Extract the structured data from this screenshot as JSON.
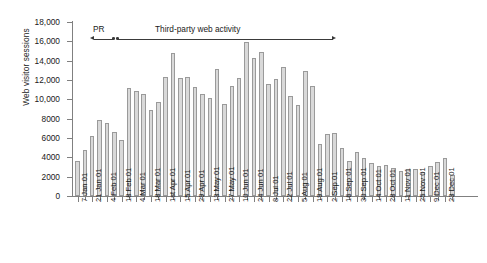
{
  "chart_data": {
    "type": "bar",
    "title": "",
    "xlabel": "",
    "ylabel": "Web visitor sessions",
    "ylim": [
      0,
      18000
    ],
    "ytick_labels": [
      "18,000",
      "16,000",
      "14,000",
      "12,000",
      "10,000",
      "8000",
      "6000",
      "4000",
      "2000",
      "0"
    ],
    "ytick_values": [
      18000,
      16000,
      14000,
      12000,
      10000,
      8000,
      6000,
      4000,
      2000,
      0
    ],
    "grid": false,
    "legend": "none",
    "categories": [
      "7 Jan 01",
      "14 Jan 01",
      "21 Jan 01",
      "28 Jan 01",
      "4 Feb 01",
      "11 Feb 01",
      "18 Feb 01",
      "25 Feb 01",
      "4 Mar 01",
      "11 Mar 01",
      "18 Mar 01",
      "25 Mar 01",
      "1st Apr 01",
      "8 Apr 01",
      "15 Apr 01",
      "22 Apr 01",
      "29 Apr 01",
      "6 May 01",
      "13 May 01",
      "20 May 01",
      "27 May 01",
      "3 Jun 01",
      "10 Jun 01",
      "17 Jun 01",
      "24 Jun 01",
      "1 Jul 01",
      "8 Jul 01",
      "15 Jul 01",
      "22 Jul 01",
      "29 Jul 01",
      "5 Aug 01",
      "12 Aug 01",
      "19 Aug 01",
      "26 Aug 01",
      "2 Sep 01",
      "9 Sep 01",
      "16 Sep 01",
      "23 Sep 01",
      "30 Sep 01",
      "7 Oct 01",
      "14 Oct 01",
      "21 Oct 01",
      "28 Oct 01",
      "4 Nov 01",
      "11 Nov 01",
      "18 Nov 01",
      "25 Nov 01",
      "2 Dec 01",
      "9 Dec 01",
      "16 Dec 01",
      "23 Dec 01",
      "30 Dec 01"
    ],
    "tick_labels_shown": [
      "7 Jan 01",
      "21 Jan 01",
      "4 Feb 01",
      "18 Feb 01",
      "4 Mar 01",
      "18 Mar 01",
      "1st Apr 01",
      "15 Apr 01",
      "29 Apr 01",
      "13 May 01",
      "27 May 01",
      "10 Jun 01",
      "24 Jun 01",
      "8 Jul 01",
      "22 Jul 01",
      "5 Aug 01",
      "19 Aug 01",
      "2 Sep 01",
      "16 Sep 01",
      "30 Sep 01",
      "14 Oct 01",
      "28 Oct 01",
      "11 Nov 01",
      "25 Nov 01",
      "9 Dec 01",
      "23 Dec 01"
    ],
    "values": [
      3650,
      4800,
      6250,
      7900,
      7550,
      6650,
      5800,
      11150,
      10850,
      10600,
      8900,
      9700,
      12300,
      14800,
      12200,
      12350,
      11250,
      10550,
      10150,
      13150,
      9550,
      11350,
      12200,
      15900,
      14250,
      14850,
      11600,
      12100,
      13300,
      10350,
      9450,
      12900,
      11350,
      5350,
      6400,
      6500,
      5000,
      3650,
      4550,
      3900,
      3400,
      3100,
      3250,
      2900,
      2600,
      2800,
      2800,
      2450,
      3100,
      3550,
      3950,
      2150
    ],
    "bar_color": "#d9d9d9",
    "bar_edge_color": "#9a9a9a"
  },
  "annotations": {
    "pr_label": "PR",
    "third_party_label": "Third-party web activity"
  }
}
